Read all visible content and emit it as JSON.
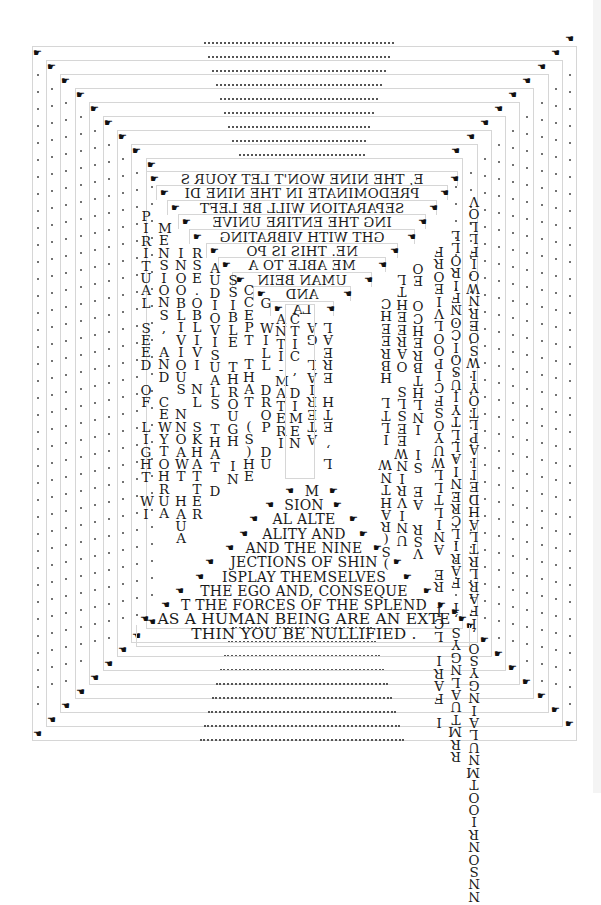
{
  "colors": {
    "background": "#ffffff",
    "frame_border": "#d6d6d6",
    "text": "#1a1a1a"
  },
  "frames": {
    "count": 12,
    "outer": {
      "x": 32,
      "y": 46,
      "w": 245,
      "h": 0
    }
  },
  "cursor_icons": {
    "top_left": "☛",
    "top_right": "☚",
    "bottom_left": "☚",
    "bottom_right": "☛"
  },
  "top_lines": [
    ".............................................",
    "..........................................",
    "........................................",
    "......................................",
    "....................................",
    "..................................",
    "................................",
    "..............................",
    ".. ..........................."
  ],
  "bottom_lines": [
    "............................",
    "..............................",
    "................................",
    "..................................",
    "....................................",
    "......................................",
    "........................................",
    "..........................................",
    "............................................"
  ],
  "mirrored_top_lines": [
    "E, THE NINE WON'T LET YOUR S",
    "PREDOMINATE IN THE NINE DI",
    "SEPARATION WILL BE LEFT",
    "ING THE ENTIRE UNIVE",
    "GHT WITH VIBRATING",
    "NE. THIS IS PO",
    "ME ABLE TO A",
    "UMAN BEIN",
    "AND",
    "LA"
  ],
  "bottom_text_lines": [
    "M",
    "SION",
    "AL ALTE",
    "ALITY AND",
    "AND THE NINE",
    "JECTIONS OF SHIN",
    "ISPLAY THEMSELVES",
    "THE EGO AND, CONSEQUE",
    "T THE FORCES OF THE SPLEND",
    "AS A HUMAN BEING ARE AN EXTE",
    "THIN YOU BE NULLIFIED ."
  ],
  "left_columns": [
    {
      "text": "PIRITUAL SEED OF LIGHT WI",
      "x": 143,
      "y": 208
    },
    {
      "text": "MENSIONS, AND CEW YTOHRUA",
      "x": 160,
      "y": 222
    },
    {
      "text": "INOOBLIVIOUSNN AEWT HOUA",
      "x": 176,
      "y": 248
    },
    {
      "text": "RSE.OBLIVI NL SKNHATTER",
      "x": 194,
      "y": 248
    },
    {
      "text": "AUDIOVISUALS THAT D",
      "x": 212,
      "y": 262
    },
    {
      "text": "SSIBLE THROUGH IN",
      "x": 229,
      "y": 275
    },
    {
      "text": "CCEPT THAT (S)HE",
      "x": 246,
      "y": 288
    },
    {
      "text": "G WILL DROP DU",
      "x": 262,
      "y": 300
    },
    {
      "text": "ANTI-MATERI",
      "x": 277,
      "y": 320
    },
    {
      "text": "CTIC, DIMEN",
      "x": 293,
      "y": 320
    }
  ],
  "right_columns": [
    {
      "text": "VOLLFIWORNREOSWIYOTLPALIIEDHALTTRAF I,O",
      "x": 470,
      "y": 196
    },
    {
      "text": "LLOIFNOCIOSIUTLLAIN ERCLIRAF I,SYNUOOMIN",
      "x": 452,
      "y": 222
    },
    {
      "text": "FROIEVLOOPICOSYUW SLLTINA ERCLIRAF",
      "x": 435,
      "y": 222
    },
    {
      "text": "OE CHER THNIIEAS LIPC",
      "x": 396,
      "y": 300
    },
    {
      "text": "CHE AGE H LTLLA",
      "x": 358,
      "y": 300
    }
  ],
  "right_strip_letters": {
    "col_a": [
      "V",
      "O",
      "L",
      "L",
      "F",
      "I",
      "O",
      "W",
      "N",
      "R",
      "E",
      "O",
      "S",
      "W",
      "I",
      "U",
      "Y",
      "O",
      "T",
      "L",
      "L",
      "S",
      "P",
      "A",
      "L",
      "T",
      "I",
      "I",
      "N",
      "A",
      "E",
      "D",
      "H",
      "A",
      "L",
      "T",
      "R",
      "L",
      "R",
      "A",
      "F",
      "I",
      "O",
      "S",
      "Y",
      "G",
      "N",
      "I",
      "A",
      "L",
      "U",
      "M",
      "T",
      "O",
      "I",
      "R",
      "N",
      "O",
      "S",
      "N"
    ],
    "col_b": [
      "L",
      "O",
      "R",
      "E",
      "I",
      "V",
      "L",
      "O",
      "O",
      "R",
      "N",
      "I",
      "C",
      "F",
      "E",
      "O",
      "S",
      "W",
      "I",
      "U",
      "Y",
      "T",
      "T",
      "L",
      "L",
      "S"
    ]
  },
  "center_columns": {
    "left_inner": "CTIC, DIMEN",
    "right_inner_a": "AG LAIRETAL",
    "right_inner_b": "AERE HTE ,L",
    "right_inner_c": "L HETRI ,SN",
    "right_inner_d": "H LTL IIAEE"
  }
}
